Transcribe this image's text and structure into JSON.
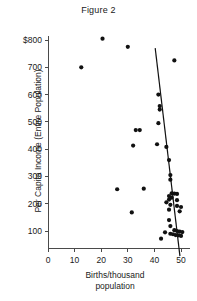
{
  "chart_data": {
    "type": "scatter",
    "title": "Figure 2",
    "xlabel_line1": "Births/thousand",
    "xlabel_line2": "population",
    "ylabel": "Per Capita Income (Entire Population)",
    "xlim": [
      0,
      52
    ],
    "ylim": [
      0,
      830
    ],
    "xticks": [
      0,
      10,
      20,
      30,
      40,
      50
    ],
    "xticklabels": [
      "0",
      "10",
      "20",
      "30",
      "40",
      "50"
    ],
    "yticks": [
      100,
      200,
      300,
      400,
      500,
      600,
      700,
      800
    ],
    "yticklabels": [
      "100",
      "200",
      "300",
      "400",
      "500",
      "600",
      "700",
      "$800"
    ],
    "grid": false,
    "legend": "none",
    "marker_color": "#111111",
    "axis_color": "#4a4a4a",
    "points": [
      [
        20.5,
        805
      ],
      [
        30.0,
        775
      ],
      [
        12.5,
        700
      ],
      [
        47.5,
        725
      ],
      [
        41.5,
        600
      ],
      [
        42.0,
        558
      ],
      [
        42.0,
        545
      ],
      [
        41.5,
        495
      ],
      [
        33.0,
        470
      ],
      [
        34.5,
        470
      ],
      [
        41.0,
        418
      ],
      [
        44.5,
        408
      ],
      [
        32.0,
        413
      ],
      [
        45.5,
        360
      ],
      [
        46.0,
        305
      ],
      [
        46.0,
        288
      ],
      [
        26.0,
        253
      ],
      [
        36.0,
        255
      ],
      [
        46.5,
        238
      ],
      [
        47.5,
        237
      ],
      [
        48.5,
        236
      ],
      [
        45.5,
        228
      ],
      [
        45.5,
        215
      ],
      [
        46.5,
        222
      ],
      [
        48.5,
        213
      ],
      [
        44.5,
        205
      ],
      [
        46.0,
        196
      ],
      [
        48.5,
        192
      ],
      [
        50.0,
        188
      ],
      [
        45.5,
        178
      ],
      [
        49.5,
        172
      ],
      [
        31.5,
        168
      ],
      [
        45.5,
        140
      ],
      [
        46.0,
        118
      ],
      [
        47.5,
        103
      ],
      [
        48.5,
        100
      ],
      [
        49.5,
        98
      ],
      [
        50.5,
        96
      ],
      [
        46.0,
        90
      ],
      [
        47.0,
        88
      ],
      [
        48.0,
        85
      ],
      [
        49.0,
        84
      ],
      [
        50.0,
        82
      ],
      [
        44.0,
        95
      ],
      [
        42.5,
        72
      ]
    ],
    "fit_line": {
      "x1": 40.3,
      "y1": 770,
      "x2": 49.6,
      "y2": 8
    }
  }
}
